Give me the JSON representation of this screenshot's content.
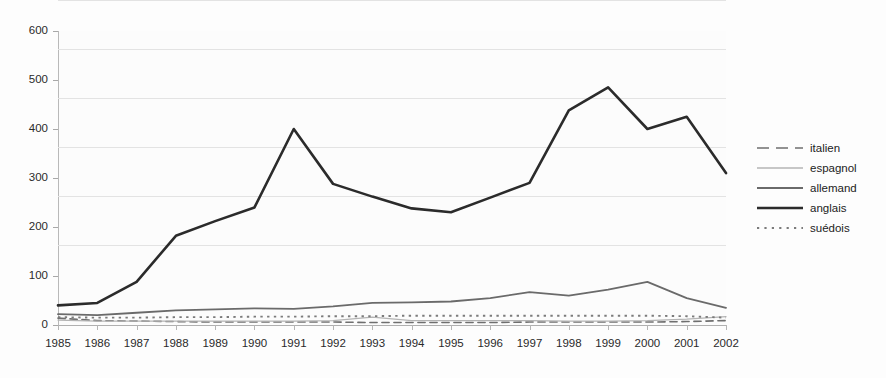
{
  "chart_data": {
    "type": "line",
    "title": "",
    "subtitle": "",
    "xlabel": "",
    "ylabel": "",
    "categories": [
      "1985",
      "1986",
      "1987",
      "1988",
      "1989",
      "1990",
      "1991",
      "1992",
      "1993",
      "1994",
      "1995",
      "1996",
      "1997",
      "1998",
      "1999",
      "2000",
      "2001",
      "2002"
    ],
    "x": [
      1985,
      1986,
      1987,
      1988,
      1989,
      1990,
      1991,
      1992,
      1993,
      1994,
      1995,
      1996,
      1997,
      1998,
      1999,
      2000,
      2001,
      2002
    ],
    "ylim": [
      0,
      600
    ],
    "xlim": [
      1985,
      2002
    ],
    "yticks": [
      0,
      100,
      200,
      300,
      400,
      500,
      600
    ],
    "ytick_labels": [
      "0",
      "100",
      "200",
      "300",
      "400",
      "500",
      "600"
    ],
    "grid": true,
    "grid_axis": "y",
    "legend_position": "right",
    "series": [
      {
        "name": "italien",
        "style": "dashed",
        "color": "#6f6f6f",
        "width": 1.6,
        "values": [
          14,
          9,
          8,
          7,
          6,
          6,
          6,
          6,
          5,
          5,
          5,
          5,
          6,
          6,
          6,
          6,
          7,
          9
        ]
      },
      {
        "name": "espagnol",
        "style": "solid",
        "color": "#b4b4b4",
        "width": 1.3,
        "values": [
          10,
          8,
          8,
          8,
          8,
          8,
          8,
          9,
          16,
          9,
          9,
          9,
          9,
          8,
          8,
          9,
          12,
          17
        ]
      },
      {
        "name": "allemand",
        "style": "solid",
        "color": "#6a6a6a",
        "width": 1.8,
        "values": [
          22,
          20,
          25,
          30,
          32,
          34,
          33,
          38,
          45,
          46,
          48,
          55,
          67,
          60,
          72,
          88,
          55,
          35
        ]
      },
      {
        "name": "anglais",
        "style": "solid",
        "color": "#2b2b2b",
        "width": 2.6,
        "values": [
          40,
          45,
          88,
          182,
          212,
          240,
          400,
          288,
          262,
          238,
          230,
          260,
          290,
          438,
          485,
          400,
          425,
          310
        ]
      },
      {
        "name": "suédois",
        "style": "dotted",
        "color": "#7b7b7b",
        "width": 1.9,
        "values": [
          16,
          15,
          15,
          16,
          16,
          17,
          17,
          18,
          18,
          19,
          19,
          19,
          19,
          19,
          19,
          19,
          18,
          15
        ]
      }
    ]
  },
  "legend": {
    "items": [
      {
        "label": "italien"
      },
      {
        "label": "espagnol"
      },
      {
        "label": "allemand"
      },
      {
        "label": "anglais"
      },
      {
        "label": "suédois"
      }
    ]
  },
  "colors": {
    "background": "#fdfdfd",
    "plot_background": "#fcfcfc",
    "gridline": "#e3e3e3",
    "axis": "#b0b0b0",
    "text": "#2a2a2a"
  }
}
